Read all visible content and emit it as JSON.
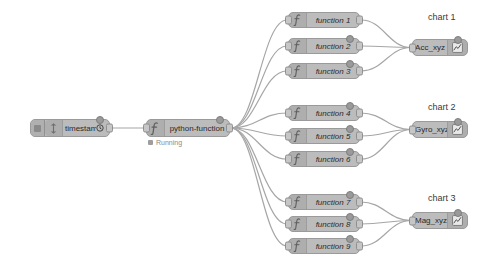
{
  "canvas": {
    "width": 501,
    "height": 266,
    "background": "#ffffff",
    "wire_color": "#a6a6a6",
    "node_fill": "#bcbcbc",
    "node_border": "#9a9a9a"
  },
  "inject_node": {
    "label": "timestamp",
    "icon": "inject-icon",
    "button_icon": "inject-button-icon",
    "repeat_icon": "clock-icon",
    "x": 30,
    "y": 119,
    "width": 80,
    "height": 18
  },
  "python_node": {
    "label": "python-function",
    "icon": "function-icon",
    "status": "Running",
    "status_icon": "status-dot-icon",
    "x": 146,
    "y": 119,
    "width": 84,
    "height": 18
  },
  "function_nodes": [
    {
      "label": "function 1",
      "icon": "function-icon",
      "x": 288,
      "y": 12,
      "width": 72,
      "height": 16,
      "dot": false
    },
    {
      "label": "function 2",
      "icon": "function-icon",
      "x": 288,
      "y": 38,
      "width": 72,
      "height": 16,
      "dot": true
    },
    {
      "label": "function 3",
      "icon": "function-icon",
      "x": 288,
      "y": 63,
      "width": 72,
      "height": 16,
      "dot": true
    },
    {
      "label": "function 4",
      "icon": "function-icon",
      "x": 288,
      "y": 105,
      "width": 72,
      "height": 16,
      "dot": true
    },
    {
      "label": "function 5",
      "icon": "function-icon",
      "x": 288,
      "y": 128,
      "width": 72,
      "height": 16,
      "dot": true
    },
    {
      "label": "function 6",
      "icon": "function-icon",
      "x": 288,
      "y": 151,
      "width": 72,
      "height": 16,
      "dot": true
    },
    {
      "label": "function 7",
      "icon": "function-icon",
      "x": 288,
      "y": 194,
      "width": 72,
      "height": 16,
      "dot": true
    },
    {
      "label": "function 8",
      "icon": "function-icon",
      "x": 288,
      "y": 216,
      "width": 72,
      "height": 16,
      "dot": true
    },
    {
      "label": "function 9",
      "icon": "function-icon",
      "x": 288,
      "y": 238,
      "width": 72,
      "height": 16,
      "dot": true
    }
  ],
  "chart_nodes": [
    {
      "title": "chart 1",
      "label": "Acc_xyz",
      "icon": "chart-icon",
      "x": 412,
      "y": 39,
      "width": 56,
      "height": 17,
      "title_x": 428,
      "title_y": 12,
      "dot": true
    },
    {
      "title": "chart 2",
      "label": "Gyro_xyz",
      "icon": "chart-icon",
      "x": 412,
      "y": 121,
      "width": 56,
      "height": 17,
      "title_x": 428,
      "title_y": 102,
      "dot": true
    },
    {
      "title": "chart 3",
      "label": "Mag_xyz",
      "icon": "chart-icon",
      "x": 412,
      "y": 212,
      "width": 56,
      "height": 17,
      "title_x": 428,
      "title_y": 193,
      "dot": true
    }
  ],
  "wires": {
    "fanout_source": {
      "x": 231,
      "y": 128
    },
    "fanin_targets": [
      {
        "x": 411,
        "y": 47
      },
      {
        "x": 411,
        "y": 129
      },
      {
        "x": 411,
        "y": 220
      }
    ],
    "count_fanout": 9,
    "count_fanin_per_chart": 3
  }
}
